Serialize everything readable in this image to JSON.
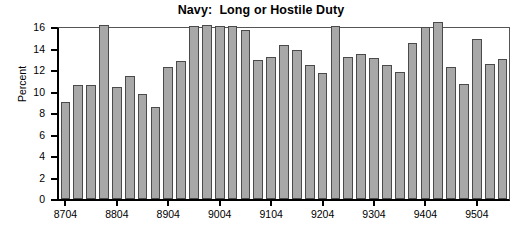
{
  "chart_data": {
    "type": "bar",
    "title": "Navy:  Long or Hostile Duty",
    "xlabel": "",
    "ylabel": "Percent",
    "ylim": [
      0,
      16
    ],
    "yticks": [
      0,
      2,
      4,
      6,
      8,
      10,
      12,
      14,
      16
    ],
    "grid": false,
    "legend": null,
    "categories": [
      "8704",
      "8801",
      "8802",
      "8803",
      "8804",
      "8901",
      "8902",
      "8903",
      "8904",
      "9001",
      "9002",
      "9003",
      "9004",
      "9101",
      "9102",
      "9103",
      "9104",
      "9201",
      "9202",
      "9203",
      "9204",
      "9301",
      "9302",
      "9303",
      "9304",
      "9401",
      "9402",
      "9403",
      "9404",
      "9501",
      "9502",
      "9503",
      "9504",
      "9601",
      "9602"
    ],
    "xtick_labels": [
      "8704",
      "8804",
      "8904",
      "9004",
      "9104",
      "9204",
      "9304",
      "9404",
      "9504"
    ],
    "xtick_indices": [
      0,
      4,
      8,
      12,
      16,
      20,
      24,
      28,
      32
    ],
    "values": [
      9.0,
      10.6,
      10.6,
      16.2,
      10.4,
      11.4,
      9.8,
      8.6,
      12.3,
      12.8,
      16.1,
      16.2,
      16.1,
      16.1,
      15.7,
      12.9,
      13.2,
      14.3,
      13.9,
      12.5,
      11.7,
      16.1,
      13.2,
      13.5,
      13.1,
      12.5,
      11.8,
      14.5,
      16.0,
      16.5,
      12.3,
      10.7,
      14.9,
      12.6,
      13.0
    ],
    "bar_color": "#a8a8a8",
    "bar_edge_color": "#4a4a4a",
    "axis_color": "#000000"
  }
}
